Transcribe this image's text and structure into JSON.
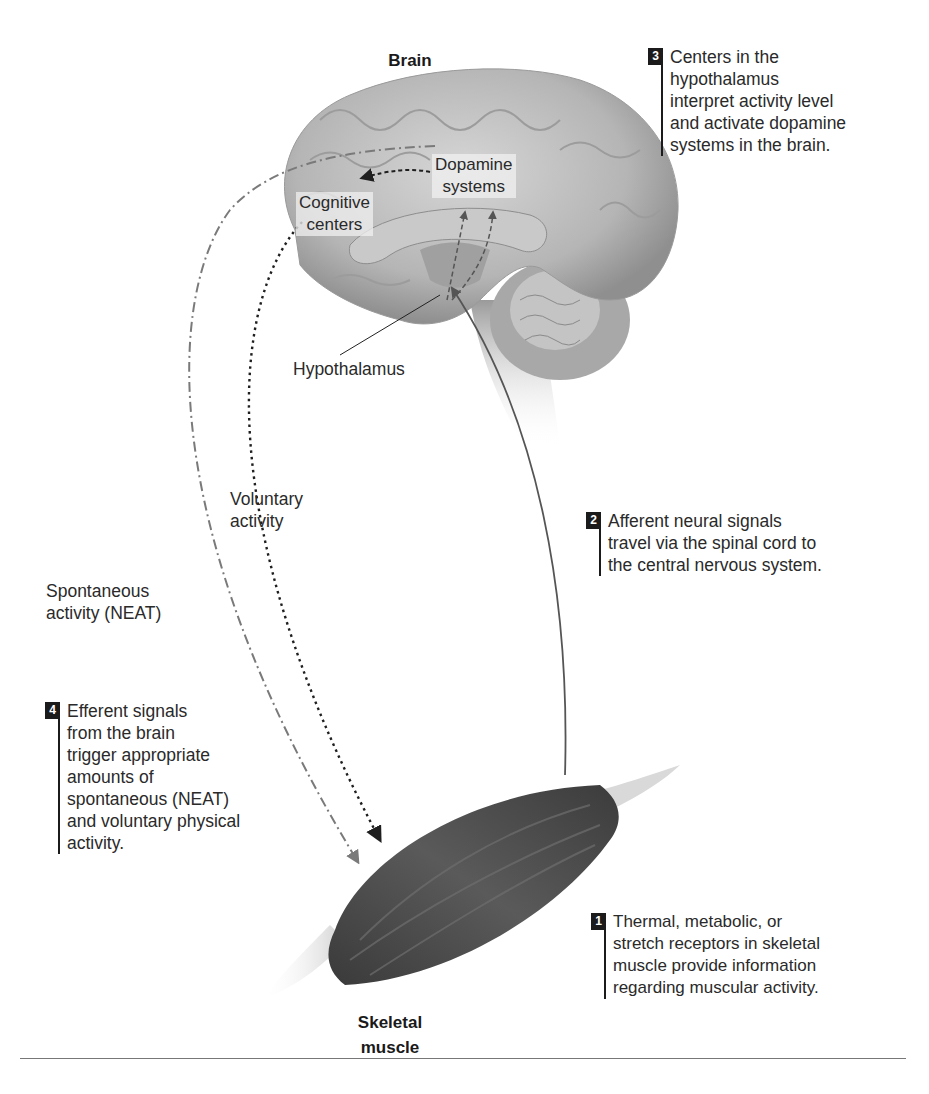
{
  "figure": {
    "titles": {
      "brain": "Brain",
      "muscle": "Skeletal\nmuscle"
    },
    "brain_labels": {
      "dopamine": "Dopamine\nsystems",
      "cognitive": "Cognitive\ncenters",
      "hypothalamus": "Hypothalamus"
    },
    "pathway_labels": {
      "voluntary": "Voluntary\nactivity",
      "spontaneous": "Spontaneous\nactivity (NEAT)"
    },
    "steps": [
      {
        "number": "1",
        "text": "Thermal, metabolic, or\nstretch receptors in skeletal\nmuscle provide information\nregarding muscular activity."
      },
      {
        "number": "2",
        "text": "Afferent neural signals\ntravel via the spinal cord to\nthe central nervous system."
      },
      {
        "number": "3",
        "text": "Centers in the\nhypothalamus\ninterpret activity level\nand activate dopamine\nsystems in the brain."
      },
      {
        "number": "4",
        "text": "Efferent signals\nfrom the brain\ntrigger appropriate\namounts of\nspontaneous (NEAT)\nand voluntary physical\nactivity."
      }
    ],
    "colors": {
      "badge": "#1b1b1b",
      "brain_fill": "#bdbdbd",
      "muscle_fill": "#4a4a4a",
      "afferent_line": "#555555",
      "voluntary_line": "#1f1f1f",
      "spontaneous_line": "#7a7a7a"
    }
  }
}
